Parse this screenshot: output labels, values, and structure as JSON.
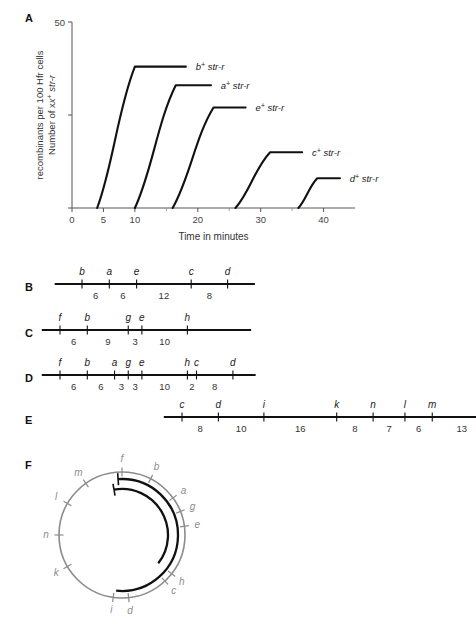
{
  "figure": {
    "panels": [
      "A",
      "B",
      "C",
      "D",
      "E",
      "F"
    ]
  },
  "chart_data": {
    "type": "line",
    "title": "",
    "xlabel": "Time in minutes",
    "ylabel": "Number of x+ str-r recombinants per 100 Hfr cells",
    "ylabel_line1": "Number of x",
    "ylabel_line1_sup": "+",
    "ylabel_line1_tail": " str-r",
    "ylabel_line2": "recombinants per 100 Hfr cells",
    "xlim": [
      0,
      45
    ],
    "ylim": [
      0,
      50
    ],
    "xticks": [
      0,
      5,
      10,
      20,
      30,
      40
    ],
    "xtick_labels": [
      "0",
      "5",
      "10",
      "20",
      "30",
      "40"
    ],
    "xminor_ticks": [
      15,
      25,
      35
    ],
    "yticks": [
      0,
      25,
      50
    ],
    "ytick_labels": [
      "",
      "",
      "50"
    ],
    "grid": false,
    "legend_position": "inline-right-of-curve",
    "series": [
      {
        "name": "b+ str-r",
        "gene": "b",
        "sup": "+",
        "suffix": " str-r",
        "onset_min": 4,
        "plateau_min": 10,
        "plateau_value": 38,
        "label_x": 19.5,
        "label_y": 38
      },
      {
        "name": "a+ str-r",
        "gene": "a",
        "sup": "+",
        "suffix": " str-r",
        "onset_min": 10,
        "plateau_min": 16.5,
        "plateau_value": 33,
        "label_x": 23.5,
        "label_y": 33
      },
      {
        "name": "e+ str-r",
        "gene": "e",
        "sup": "+",
        "suffix": " str-r",
        "onset_min": 16,
        "plateau_min": 22.5,
        "plateau_value": 27,
        "label_x": 29.0,
        "label_y": 27
      },
      {
        "name": "c+ str-r",
        "gene": "c",
        "sup": "+",
        "suffix": " str-r",
        "onset_min": 26,
        "plateau_min": 31.5,
        "plateau_value": 15,
        "label_x": 38.0,
        "label_y": 15
      },
      {
        "name": "d+ str-r",
        "gene": "d",
        "sup": "+",
        "suffix": " str-r",
        "onset_min": 36,
        "plateau_min": 39.0,
        "plateau_value": 8,
        "label_x": 44.0,
        "label_y": 8
      }
    ]
  },
  "maps": {
    "B": {
      "letter": "B",
      "genes": [
        "b",
        "a",
        "e",
        "c",
        "d"
      ],
      "distances": [
        6,
        6,
        12,
        8
      ],
      "lead_in": 6,
      "lead_out": 6
    },
    "C": {
      "letter": "C",
      "genes": [
        "f",
        "b",
        "g",
        "e",
        "h"
      ],
      "distances": [
        6,
        9,
        3,
        10
      ],
      "lead_in": 4,
      "lead_out": 14
    },
    "D": {
      "letter": "D",
      "genes": [
        "f",
        "b",
        "a",
        "g",
        "e",
        "h",
        "c",
        "d"
      ],
      "distances": [
        6,
        6,
        3,
        3,
        10,
        2,
        8
      ],
      "lead_in": 4,
      "lead_out": 5
    },
    "E": {
      "letter": "E",
      "genes": [
        "c",
        "d",
        "i",
        "k",
        "n",
        "l",
        "m",
        "f"
      ],
      "distances": [
        8,
        10,
        16,
        8,
        7,
        6,
        13
      ],
      "lead_in": 4,
      "lead_out": 5
    }
  },
  "circle_map": {
    "letter": "F",
    "genes": [
      {
        "label": "f",
        "angle_deg": 0
      },
      {
        "label": "b",
        "angle_deg": 27
      },
      {
        "label": "a",
        "angle_deg": 54
      },
      {
        "label": "g",
        "angle_deg": 68
      },
      {
        "label": "e",
        "angle_deg": 82
      },
      {
        "label": "h",
        "angle_deg": 128
      },
      {
        "label": "c",
        "angle_deg": 137
      },
      {
        "label": "d",
        "angle_deg": 174
      },
      {
        "label": "i",
        "angle_deg": 188
      },
      {
        "label": "k",
        "angle_deg": 240
      },
      {
        "label": "n",
        "angle_deg": 270
      },
      {
        "label": "l",
        "angle_deg": 300
      },
      {
        "label": "m",
        "angle_deg": 325
      }
    ],
    "outer_circle_color": "#8c8c8c",
    "arc_color": "#111111",
    "label_color": "#8c8c8c",
    "arcs": [
      {
        "name": "hfr-arc-outer",
        "start_deg": 356,
        "end_deg": 186,
        "radius": 56
      },
      {
        "name": "hfr-arc-inner",
        "start_deg": 350,
        "end_deg": 128,
        "radius": 46
      }
    ]
  }
}
